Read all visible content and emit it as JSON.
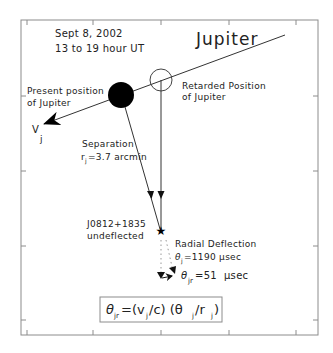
{
  "header": {
    "date": "Sept 8, 2002",
    "time_range": "13 to 19 hour UT",
    "planet": "Jupiter"
  },
  "labels": {
    "present_position": [
      "Present position",
      "of Jupiter"
    ],
    "retarded_position": [
      "Retarded Position",
      "of Jupiter"
    ],
    "velocity": {
      "symbol": "V",
      "subscript": "j"
    },
    "separation": {
      "title": "Separation",
      "symbol": "r",
      "subscript": "j",
      "value": "=3.7 arcmin"
    },
    "source": [
      "J0812+1835",
      "undeflected"
    ],
    "radial_deflection": {
      "title": "Radial Deflection",
      "symbol": "θ",
      "subscript": "j",
      "value": "=1190 μsec"
    },
    "retarded_deflection": {
      "symbol": "θ",
      "subscript": "jr",
      "value": "=51  μsec"
    }
  },
  "formula": {
    "lhs_symbol": "θ",
    "lhs_subscript": "jr",
    "part1": "=(v",
    "part1_sub": "j",
    "part2": "/c) (θ",
    "part2_sub": "j",
    "part3": "/r",
    "part3_sub": "j",
    "part4": ")"
  },
  "colors": {
    "frame": "#8c8c8c",
    "line": "#333333",
    "fill": "#000000",
    "dotted": "#999999"
  }
}
